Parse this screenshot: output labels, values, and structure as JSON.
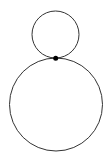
{
  "diagram": {
    "type": "tangent-circles",
    "background": "#ffffff",
    "stroke_color": "#333333",
    "point_color": "#000000",
    "circles": [
      {
        "name": "small-circle",
        "cx": 55.5,
        "cy": 34.5,
        "r": 23.5
      },
      {
        "name": "large-circle",
        "cx": 56,
        "cy": 104.5,
        "r": 46.5
      }
    ],
    "tangent_point": {
      "x": 55.7,
      "y": 58.2,
      "r": 2.5
    }
  }
}
